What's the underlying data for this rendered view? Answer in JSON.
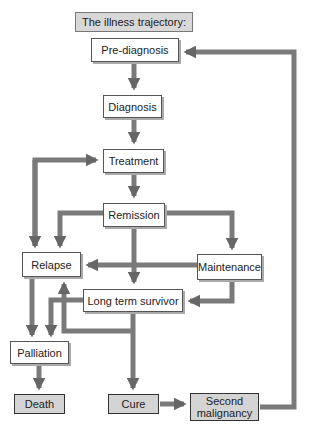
{
  "diagram": {
    "title": "The illness trajectory:",
    "nodes": {
      "prediagnosis": "Pre-diagnosis",
      "diagnosis": "Diagnosis",
      "treatment": "Treatment",
      "remission": "Remission",
      "relapse": "Relapse",
      "maintenance": "Maintenance",
      "long_term_survivor": "Long term survivor",
      "palliation": "Palliation",
      "death": "Death",
      "cure": "Cure",
      "second_malignancy": "Second malignancy"
    },
    "edges": [
      {
        "from": "Pre-diagnosis",
        "to": "Diagnosis"
      },
      {
        "from": "Diagnosis",
        "to": "Treatment"
      },
      {
        "from": "Treatment",
        "to": "Remission"
      },
      {
        "from": "Relapse",
        "to": "Treatment"
      },
      {
        "from": "Remission",
        "to": "Relapse"
      },
      {
        "from": "Remission",
        "to": "Maintenance"
      },
      {
        "from": "Remission",
        "to": "Long term survivor"
      },
      {
        "from": "Maintenance",
        "to": "Relapse"
      },
      {
        "from": "Maintenance",
        "to": "Long term survivor"
      },
      {
        "from": "Relapse",
        "to": "Palliation"
      },
      {
        "from": "Long term survivor",
        "to": "Palliation"
      },
      {
        "from": "Long term survivor",
        "to": "Relapse"
      },
      {
        "from": "Long term survivor",
        "to": "Cure"
      },
      {
        "from": "Palliation",
        "to": "Death"
      },
      {
        "from": "Cure",
        "to": "Second malignancy"
      },
      {
        "from": "Second malignancy",
        "to": "Pre-diagnosis"
      }
    ],
    "colors": {
      "arrow": "#6e6e6e",
      "terminal_fill": "#d4d4d4",
      "box_fill": "#ffffff"
    }
  }
}
